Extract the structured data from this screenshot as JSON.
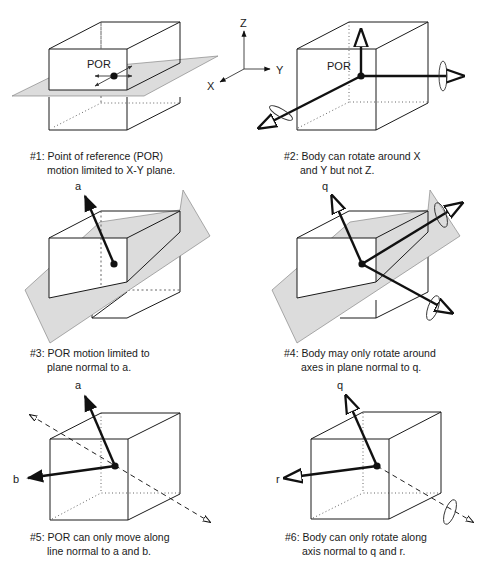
{
  "axes": {
    "z": "Z",
    "y": "Y",
    "x": "X"
  },
  "panels": [
    {
      "id": 1,
      "point_label": "POR",
      "caption_line1": "#1: Point of reference (POR)",
      "caption_line2": "motion limited to X-Y plane."
    },
    {
      "id": 2,
      "point_label": "POR",
      "caption_line1": "#2: Body can rotate around X",
      "caption_line2": "and Y but not Z."
    },
    {
      "id": 3,
      "vector_label": "a",
      "caption_line1": "#3: POR motion limited to",
      "caption_line2": "plane normal to a."
    },
    {
      "id": 4,
      "vector_label": "q",
      "caption_line1": "#4: Body may only rotate around",
      "caption_line2": "axes in plane normal to q."
    },
    {
      "id": 5,
      "vector_label_1": "a",
      "vector_label_2": "b",
      "caption_line1": "#5: POR can only move along",
      "caption_line2": "line normal to a and b."
    },
    {
      "id": 6,
      "vector_label_1": "q",
      "vector_label_2": "r",
      "caption_line1": "#6: Body can only rotate along",
      "caption_line2": "axis normal to q and r."
    }
  ],
  "colors": {
    "plane_fill": "#dcdcdc",
    "line": "#1a1a1a"
  }
}
